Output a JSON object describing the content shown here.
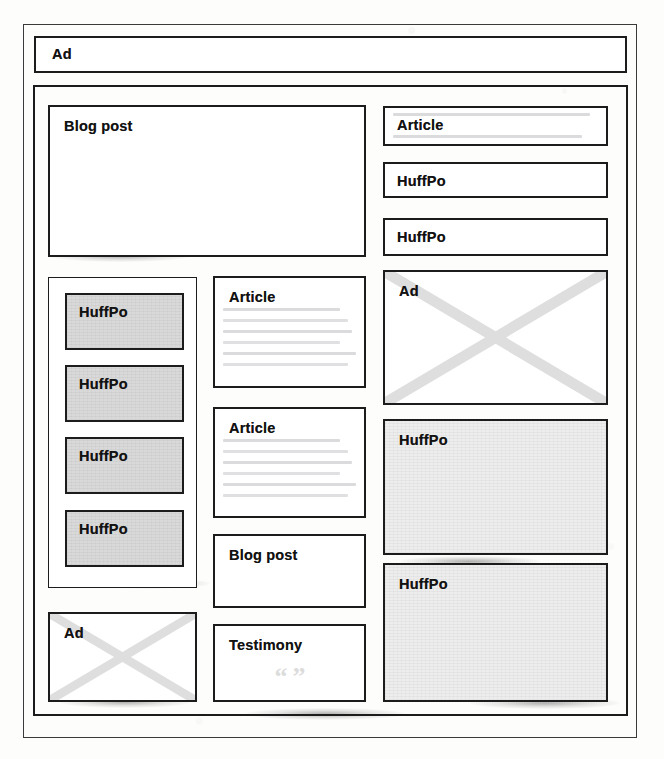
{
  "page": {
    "background_color": "#fdfdfc",
    "line_color": "#1c1c1c",
    "gray_fill": "#d9d9d9",
    "light_gray_fill": "#ededed"
  },
  "banner": {
    "label": "Ad"
  },
  "main": {
    "hero": {
      "label": "Blog post"
    },
    "left_column": {
      "items": [
        {
          "label": "HuffPo"
        },
        {
          "label": "HuffPo"
        },
        {
          "label": "HuffPo"
        },
        {
          "label": "HuffPo"
        }
      ],
      "ad": {
        "label": "Ad"
      }
    },
    "middle_column": {
      "items": [
        {
          "label": "Article"
        },
        {
          "label": "Article"
        },
        {
          "label": "Blog post"
        },
        {
          "label": "Testimony",
          "quote_glyph": "“”"
        }
      ]
    },
    "right_column": {
      "items": [
        {
          "label": "Article"
        },
        {
          "label": "HuffPo"
        },
        {
          "label": "HuffPo"
        },
        {
          "label": "Ad"
        },
        {
          "label": "HuffPo"
        },
        {
          "label": "HuffPo"
        }
      ]
    }
  }
}
